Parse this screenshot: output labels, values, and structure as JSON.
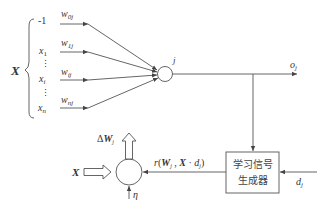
{
  "diagram": {
    "type": "neural-learning-rule",
    "input_vector_label": "X",
    "inputs": [
      {
        "label": "-1",
        "weight": "w",
        "weight_sub": "0j"
      },
      {
        "label": "x",
        "label_sub": "1",
        "weight": "w",
        "weight_sub": "1j"
      },
      {
        "label": "x",
        "label_sub": "i",
        "weight": "w",
        "weight_sub": "ij"
      },
      {
        "label": "x",
        "label_sub": "n",
        "weight": "w",
        "weight_sub": "nj"
      }
    ],
    "ellipsis": "⋮",
    "neuron_label": "j",
    "output_label": "o",
    "output_sub": "j",
    "learning_signal_box": {
      "line1": "学习信号",
      "line2": "生成器"
    },
    "desired_label": "d",
    "desired_sub": "j",
    "signal_text": {
      "r": "r",
      "open": "(",
      "W": "W",
      "W_sub": "j",
      "comma1": " , ",
      "X": "X",
      "dot": " · ",
      "d": "d",
      "d_sub": "j",
      "close": ")"
    },
    "delta_label": {
      "delta": "Δ",
      "W": "W",
      "sub": "j"
    },
    "x_input_label": "X",
    "eta_label": "η",
    "colors": {
      "line": "#555555",
      "text": "#333333",
      "background": "#ffffff"
    }
  }
}
